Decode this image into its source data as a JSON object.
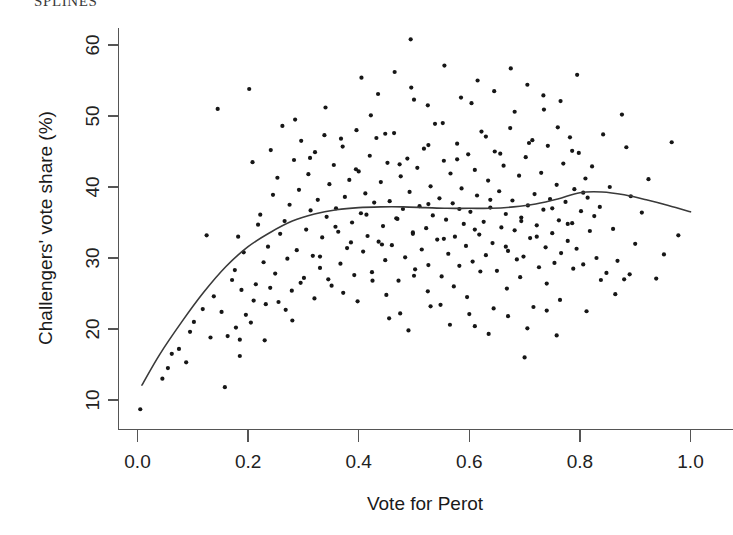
{
  "header": {
    "partial_text": "SPLINES"
  },
  "chart_data": {
    "type": "scatter",
    "title": "",
    "xlabel": "Vote for Perot",
    "ylabel": "Challengers' vote share (%)",
    "xlim": [
      -0.02,
      1.04
    ],
    "ylim": [
      7.0,
      62.5
    ],
    "xticks": [
      0.0,
      0.2,
      0.4,
      0.6,
      0.8,
      1.0
    ],
    "xticklabels": [
      "0.0",
      "0.2",
      "0.4",
      "0.6",
      "0.8",
      "1.0"
    ],
    "yticks": [
      10,
      20,
      30,
      40,
      50,
      60
    ],
    "yticklabels": [
      "10",
      "20",
      "30",
      "40",
      "50",
      "60"
    ],
    "grid": false,
    "legend": null,
    "point_color": "#161616",
    "line_color": "#3a3a3a",
    "point_size": 2.1,
    "series": [
      {
        "name": "Districts",
        "type": "scatter",
        "x": [
          0.005,
          0.045,
          0.055,
          0.062,
          0.075,
          0.088,
          0.095,
          0.102,
          0.118,
          0.125,
          0.132,
          0.138,
          0.145,
          0.152,
          0.158,
          0.163,
          0.171,
          0.176,
          0.178,
          0.182,
          0.185,
          0.188,
          0.192,
          0.196,
          0.202,
          0.208,
          0.214,
          0.218,
          0.222,
          0.228,
          0.232,
          0.236,
          0.241,
          0.245,
          0.249,
          0.253,
          0.258,
          0.262,
          0.266,
          0.271,
          0.275,
          0.279,
          0.283,
          0.288,
          0.292,
          0.296,
          0.301,
          0.305,
          0.309,
          0.313,
          0.317,
          0.321,
          0.326,
          0.33,
          0.334,
          0.338,
          0.342,
          0.347,
          0.351,
          0.355,
          0.359,
          0.363,
          0.367,
          0.371,
          0.375,
          0.379,
          0.383,
          0.388,
          0.392,
          0.396,
          0.4,
          0.404,
          0.408,
          0.412,
          0.416,
          0.42,
          0.424,
          0.428,
          0.432,
          0.436,
          0.44,
          0.444,
          0.448,
          0.452,
          0.456,
          0.46,
          0.464,
          0.468,
          0.472,
          0.476,
          0.48,
          0.484,
          0.488,
          0.492,
          0.494,
          0.498,
          0.502,
          0.506,
          0.51,
          0.514,
          0.518,
          0.522,
          0.526,
          0.53,
          0.534,
          0.538,
          0.542,
          0.546,
          0.55,
          0.554,
          0.558,
          0.562,
          0.566,
          0.57,
          0.574,
          0.578,
          0.582,
          0.586,
          0.59,
          0.594,
          0.598,
          0.602,
          0.606,
          0.61,
          0.614,
          0.618,
          0.622,
          0.626,
          0.63,
          0.634,
          0.638,
          0.642,
          0.646,
          0.65,
          0.654,
          0.658,
          0.662,
          0.666,
          0.67,
          0.674,
          0.678,
          0.682,
          0.686,
          0.69,
          0.694,
          0.698,
          0.702,
          0.706,
          0.71,
          0.714,
          0.718,
          0.722,
          0.726,
          0.73,
          0.734,
          0.738,
          0.742,
          0.746,
          0.75,
          0.754,
          0.758,
          0.762,
          0.766,
          0.77,
          0.774,
          0.778,
          0.782,
          0.786,
          0.79,
          0.794,
          0.798,
          0.802,
          0.806,
          0.81,
          0.814,
          0.818,
          0.822,
          0.826,
          0.83,
          0.836,
          0.842,
          0.848,
          0.854,
          0.86,
          0.868,
          0.876,
          0.884,
          0.892,
          0.9,
          0.912,
          0.924,
          0.938,
          0.952,
          0.966,
          0.978,
          0.21,
          0.24,
          0.268,
          0.295,
          0.32,
          0.345,
          0.372,
          0.398,
          0.425,
          0.45,
          0.475,
          0.5,
          0.525,
          0.548,
          0.572,
          0.596,
          0.62,
          0.644,
          0.668,
          0.692,
          0.716,
          0.74,
          0.764,
          0.788,
          0.812,
          0.838,
          0.864,
          0.89,
          0.285,
          0.312,
          0.34,
          0.368,
          0.395,
          0.422,
          0.448,
          0.474,
          0.5,
          0.526,
          0.552,
          0.578,
          0.604,
          0.63,
          0.656,
          0.682,
          0.708,
          0.734,
          0.76,
          0.786,
          0.33,
          0.358,
          0.386,
          0.414,
          0.442,
          0.47,
          0.498,
          0.526,
          0.554,
          0.582,
          0.61,
          0.638,
          0.666,
          0.694,
          0.722,
          0.75,
          0.778,
          0.806,
          0.405,
          0.435,
          0.465,
          0.495,
          0.525,
          0.555,
          0.585,
          0.615,
          0.645,
          0.675,
          0.705,
          0.735,
          0.765,
          0.795,
          0.455,
          0.49,
          0.53,
          0.565,
          0.6,
          0.635,
          0.67,
          0.705,
          0.74,
          0.185,
          0.205,
          0.23,
          0.255,
          0.28,
          0.61,
          0.7,
          0.758,
          0.88
        ],
        "y": [
          8.7,
          13.0,
          14.5,
          16.5,
          17.2,
          15.3,
          19.6,
          21.0,
          22.8,
          33.2,
          18.8,
          24.6,
          51.0,
          22.4,
          11.8,
          19.0,
          26.9,
          28.3,
          20.2,
          33.0,
          18.5,
          25.5,
          30.8,
          22.0,
          53.8,
          43.5,
          26.3,
          34.7,
          36.1,
          29.4,
          23.5,
          31.6,
          45.2,
          38.9,
          27.8,
          41.3,
          33.4,
          48.6,
          35.2,
          29.9,
          37.5,
          25.4,
          43.8,
          31.1,
          39.6,
          46.5,
          27.2,
          34.0,
          41.8,
          36.7,
          30.3,
          44.9,
          38.2,
          28.6,
          32.9,
          47.3,
          35.8,
          40.4,
          26.1,
          43.1,
          37.0,
          33.7,
          29.2,
          45.7,
          38.6,
          31.4,
          41.0,
          35.0,
          27.6,
          48.0,
          42.2,
          36.3,
          30.9,
          39.1,
          33.1,
          44.4,
          28.0,
          37.8,
          46.9,
          32.3,
          40.7,
          34.5,
          29.7,
          43.4,
          38.0,
          31.8,
          47.6,
          35.6,
          26.8,
          41.5,
          36.9,
          30.1,
          44.0,
          39.3,
          60.8,
          33.6,
          28.4,
          42.7,
          37.3,
          31.2,
          45.4,
          34.2,
          29.0,
          40.1,
          36.0,
          48.9,
          32.6,
          38.4,
          27.4,
          43.7,
          35.4,
          30.6,
          41.9,
          37.7,
          33.0,
          46.1,
          28.9,
          39.8,
          34.8,
          31.7,
          44.6,
          36.5,
          29.5,
          42.4,
          38.8,
          33.3,
          47.8,
          35.1,
          30.4,
          40.9,
          37.1,
          32.1,
          45.0,
          28.2,
          39.4,
          34.3,
          43.0,
          36.2,
          31.0,
          48.3,
          38.1,
          33.9,
          29.8,
          41.6,
          35.7,
          30.2,
          44.2,
          37.4,
          32.8,
          46.6,
          39.0,
          34.6,
          28.7,
          42.0,
          36.8,
          31.5,
          45.8,
          38.3,
          33.5,
          29.3,
          40.3,
          35.3,
          30.7,
          43.3,
          37.9,
          32.4,
          47.0,
          34.9,
          39.7,
          31.3,
          44.8,
          36.6,
          29.1,
          41.2,
          38.5,
          33.8,
          42.9,
          35.9,
          30.0,
          37.2,
          47.4,
          27.9,
          40.0,
          34.1,
          29.6,
          50.2,
          45.6,
          38.7,
          32.0,
          36.4,
          41.1,
          27.1,
          30.5,
          46.3,
          33.2,
          24.0,
          25.8,
          22.7,
          26.5,
          24.3,
          27.0,
          25.1,
          23.9,
          26.8,
          24.8,
          22.2,
          27.5,
          25.3,
          23.4,
          26.0,
          24.5,
          28.1,
          22.9,
          25.7,
          27.3,
          23.1,
          26.4,
          24.1,
          28.5,
          22.5,
          26.9,
          24.9,
          27.7,
          49.5,
          44.1,
          51.2,
          46.8,
          42.5,
          50.1,
          47.5,
          43.2,
          52.3,
          45.9,
          49.0,
          43.9,
          51.8,
          47.1,
          44.7,
          50.6,
          46.2,
          52.9,
          48.4,
          45.1,
          30.2,
          34.4,
          32.2,
          36.1,
          31.9,
          35.5,
          33.4,
          37.6,
          32.7,
          36.9,
          34.0,
          38.2,
          31.6,
          35.2,
          33.0,
          37.0,
          34.8,
          39.2,
          55.4,
          53.1,
          56.2,
          54.0,
          51.5,
          57.1,
          52.6,
          55.0,
          53.5,
          56.7,
          54.4,
          50.9,
          52.1,
          55.8,
          21.5,
          19.8,
          23.2,
          20.6,
          22.1,
          19.3,
          21.8,
          20.1,
          22.6,
          16.2,
          20.9,
          18.4,
          23.8,
          21.2,
          20.4,
          16.0,
          19.1,
          27.0
        ]
      },
      {
        "name": "Smoothing spline",
        "type": "line",
        "x": [
          0.008,
          0.04,
          0.08,
          0.12,
          0.16,
          0.2,
          0.24,
          0.28,
          0.32,
          0.36,
          0.4,
          0.44,
          0.48,
          0.52,
          0.56,
          0.6,
          0.64,
          0.68,
          0.72,
          0.76,
          0.8,
          0.84,
          0.88,
          0.92,
          0.96,
          1.0
        ],
        "y": [
          12.1,
          16.4,
          21.0,
          25.2,
          28.8,
          31.6,
          33.6,
          35.2,
          36.2,
          36.8,
          37.1,
          37.2,
          37.2,
          37.1,
          37.0,
          37.0,
          37.0,
          37.2,
          37.6,
          38.3,
          39.2,
          39.3,
          38.9,
          38.2,
          37.4,
          36.5
        ]
      }
    ]
  }
}
